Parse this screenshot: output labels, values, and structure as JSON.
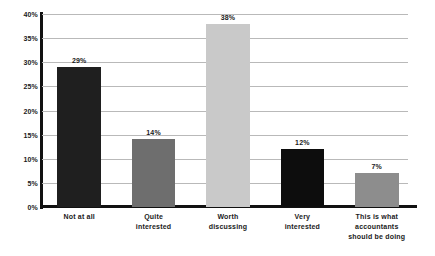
{
  "chart_data": {
    "type": "bar",
    "title": "",
    "subtitle": "",
    "xlabel": "",
    "ylabel": "",
    "categories": [
      "Not at all",
      "Quite interested",
      "Worth discussing",
      "Very interested",
      "This is what accountants should be doing"
    ],
    "category_lines": [
      [
        "Not at all"
      ],
      [
        "Quite",
        "interested"
      ],
      [
        "Worth",
        "discussing"
      ],
      [
        "Very",
        "interested"
      ],
      [
        "This is what",
        "accountants",
        "should be doing"
      ]
    ],
    "values": [
      29,
      14,
      38,
      12,
      7
    ],
    "value_labels": [
      "29%",
      "14%",
      "38%",
      "12%",
      "7%"
    ],
    "bar_colors": [
      "#1f1f1f",
      "#6e6e6e",
      "#c9c9c9",
      "#0d0d0d",
      "#8d8d8d"
    ],
    "ylim": [
      0,
      40
    ],
    "ytick_values": [
      0,
      5,
      10,
      15,
      20,
      25,
      30,
      35,
      40
    ],
    "ytick_labels": [
      "0%",
      "5%",
      "10%",
      "15%",
      "20%",
      "25%",
      "30%",
      "35%",
      "40%"
    ],
    "grid": true,
    "grid_color": "#b9b9b9",
    "axis_color": "#111111",
    "legend": false,
    "background": "#ffffff"
  }
}
